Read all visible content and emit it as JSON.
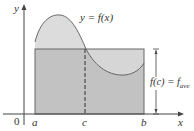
{
  "figure": {
    "axis_labels": {
      "y": "y",
      "x": "x",
      "origin": "0"
    },
    "curve_label": "y = f(x)",
    "tick_labels": {
      "a": "a",
      "c": "c",
      "b": "b"
    },
    "height_label": "f(c) = f",
    "height_label_sub": "ave"
  },
  "colors": {
    "curve_fill": "#dcdcdc",
    "rect_fill": "#bdbdbd",
    "lines": "#555555"
  }
}
